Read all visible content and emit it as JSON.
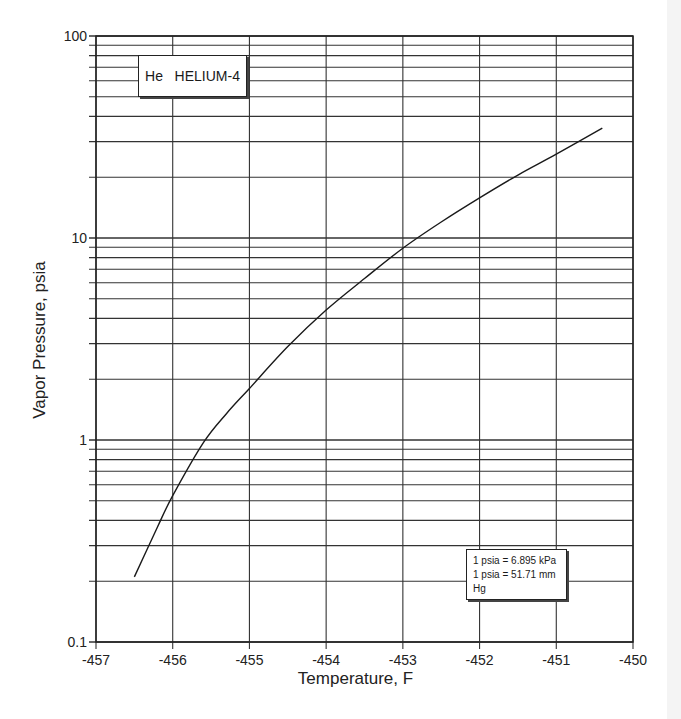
{
  "chart_data": {
    "type": "line",
    "xlabel": "Temperature, F",
    "ylabel": "Vapor Pressure, psia",
    "x_scale": "linear",
    "y_scale": "log",
    "xlim": [
      -457,
      -450
    ],
    "ylim": [
      0.1,
      100
    ],
    "x_ticks": [
      "-457",
      "-456",
      "-455",
      "-454",
      "-453",
      "-452",
      "-451",
      "-450"
    ],
    "y_ticks": [
      "0.1",
      "1",
      "10",
      "100"
    ],
    "grid": true,
    "legend": null,
    "series": [
      {
        "name": "Helium-4 vapor pressure",
        "x": [
          -456.5,
          -456.2,
          -456.0,
          -455.6,
          -455.3,
          -455.0,
          -454.5,
          -454.0,
          -453.5,
          -453.0,
          -452.5,
          -452.0,
          -451.5,
          -451.0,
          -450.4
        ],
        "y": [
          0.21,
          0.37,
          0.53,
          0.97,
          1.35,
          1.8,
          2.9,
          4.4,
          6.3,
          8.9,
          12.0,
          15.8,
          20.5,
          26.0,
          35.0
        ]
      }
    ],
    "annotations": [
      "1 psia = 6.895 kPa",
      "1 psia = 51.71 mm Hg"
    ]
  },
  "title_box": {
    "symbol": "He",
    "name": "HELIUM-4"
  },
  "conversion_box": {
    "line1": "1 psia = 6.895 kPa",
    "line2": "1 psia = 51.71 mm Hg"
  },
  "axes": {
    "xlabel": "Temperature, F",
    "ylabel": "Vapor Pressure, psia"
  },
  "colors": {
    "grid": "#333333",
    "curve": "#1a1a1a",
    "background": "#ffffff"
  }
}
